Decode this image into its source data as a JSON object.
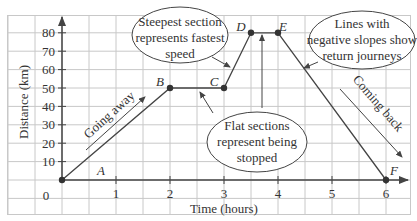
{
  "chart_data": {
    "type": "line",
    "title": "",
    "xlabel": "Time (hours)",
    "ylabel": "Distance (km)",
    "xlim": [
      0,
      6
    ],
    "ylim": [
      0,
      80
    ],
    "x_ticks": [
      "1",
      "2",
      "3",
      "4",
      "5",
      "6"
    ],
    "y_ticks": [
      "10",
      "20",
      "30",
      "40",
      "50",
      "60",
      "70",
      "80"
    ],
    "origin_label": "0",
    "grid": true,
    "series": [
      {
        "name": "Journey",
        "points": [
          {
            "label": "O",
            "x": 0,
            "y": 0
          },
          {
            "label": "B",
            "x": 2,
            "y": 50
          },
          {
            "label": "C",
            "x": 3,
            "y": 50
          },
          {
            "label": "D",
            "x": 3.5,
            "y": 80
          },
          {
            "label": "E",
            "x": 4,
            "y": 80
          },
          {
            "label": "F",
            "x": 6,
            "y": 0
          }
        ]
      }
    ],
    "segment_labels": {
      "A": "A"
    },
    "point_labels": {
      "A": "A",
      "B": "B",
      "C": "C",
      "D": "D",
      "E": "E",
      "F": "F"
    },
    "annotations": {
      "going_away": "Going away",
      "coming_back": "Coming back",
      "steepest": [
        "Steepest section",
        "represents fastest",
        "speed"
      ],
      "flat": [
        "Flat sections",
        "represent being",
        "stopped"
      ],
      "negative": [
        "Lines with",
        "negative slopes show",
        "return journeys"
      ]
    },
    "colors": {
      "line": "#444444",
      "grid": "#c8c8c8",
      "axis": "#444444",
      "text": "#333333"
    }
  }
}
